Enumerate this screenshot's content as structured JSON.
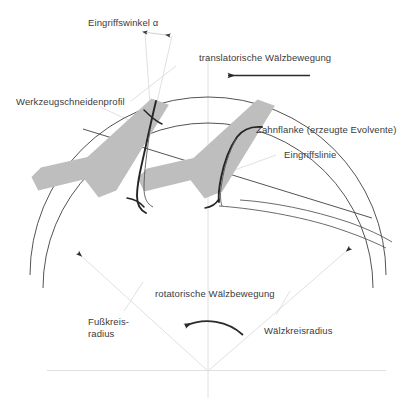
{
  "figure": {
    "title_absent": true,
    "background_color": "#ffffff",
    "ink_color": "#3b3b3b",
    "construction_line_color": "#d8d8d8",
    "tool_fill_color": "#bfbfbf",
    "dark_curve_color": "#2a2a2a",
    "thin_curve_color": "#555555"
  },
  "labels": {
    "pressure_angle": "Eingriffswinkel α",
    "translational_motion": "translatorische Wälzbewegung",
    "tool_cutting_profile": "Werkzeugschneidenprofil",
    "tooth_flank": "Zahnflanke (erzeugte Evolvente)",
    "line_of_action": "Eingriffslinie",
    "rotational_motion": "rotatorische Wälzbewegung",
    "root_circle_radius_line1": "Fußkreis-",
    "root_circle_radius_line2": "radius",
    "pitch_circle_radius": "Wälzkreisradius"
  },
  "geometry": {
    "center_x": 208,
    "center_y": 371,
    "pitch_circle_radius": 178,
    "root_circle_radius": 165,
    "pressure_angle_deg": 20,
    "tool_profile_count": 2,
    "involute_count": 2
  },
  "arrows": {
    "translational_direction": "left",
    "rotational_direction": "counter-clockwise",
    "angle_marker": "double-headed"
  }
}
